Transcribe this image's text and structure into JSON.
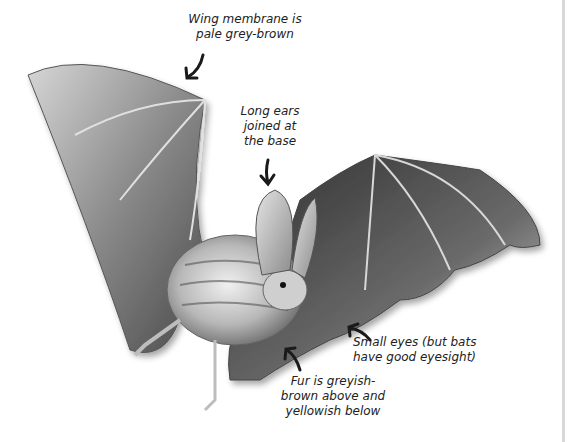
{
  "diagram": {
    "labels": {
      "wing": [
        "Wing membrane is",
        "pale grey-brown"
      ],
      "ears": [
        "Long ears",
        "joined at",
        "the base"
      ],
      "eyes": [
        "Small eyes (but bats",
        "have good eyesight)"
      ],
      "fur": [
        "Fur is greyish-",
        "brown above and",
        "yellowish below"
      ]
    },
    "colors": {
      "background": "#ffffff",
      "text": "#222222",
      "arrow": "#1a1a1a",
      "membrane_dark": "#3a3a3a",
      "membrane_light": "#c8c8c8"
    }
  }
}
